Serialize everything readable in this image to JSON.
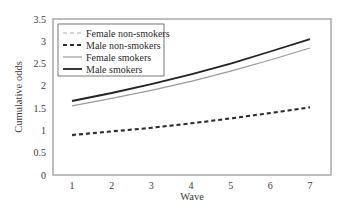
{
  "chart_data": {
    "type": "line",
    "title": "",
    "xlabel": "Wave",
    "ylabel": "Cumulative odds",
    "x": [
      1,
      2,
      3,
      4,
      5,
      6,
      7
    ],
    "xticks": [
      "1",
      "2",
      "3",
      "4",
      "5",
      "6",
      "7"
    ],
    "yticks": [
      "0",
      "0.5",
      "1",
      "1.5",
      "2",
      "2.5",
      "3",
      "3.5"
    ],
    "ylim": [
      0,
      3.5
    ],
    "grid": false,
    "legend_position": "upper left",
    "series": [
      {
        "name": "Female non-smokers",
        "style": "dashed",
        "color": "#b0b0b0",
        "width": 1.2,
        "values": [
          0.88,
          0.96,
          1.05,
          1.15,
          1.26,
          1.38,
          1.51
        ]
      },
      {
        "name": "Male non-smokers",
        "style": "dashed",
        "color": "#2a2a2a",
        "width": 2,
        "values": [
          0.9,
          0.98,
          1.06,
          1.16,
          1.27,
          1.39,
          1.52
        ]
      },
      {
        "name": "Female smokers",
        "style": "solid",
        "color": "#9a9a9a",
        "width": 1.2,
        "values": [
          1.55,
          1.72,
          1.9,
          2.1,
          2.33,
          2.58,
          2.85
        ]
      },
      {
        "name": "Male smokers",
        "style": "solid",
        "color": "#222222",
        "width": 1.8,
        "values": [
          1.66,
          1.84,
          2.04,
          2.26,
          2.5,
          2.77,
          3.05
        ]
      }
    ]
  }
}
